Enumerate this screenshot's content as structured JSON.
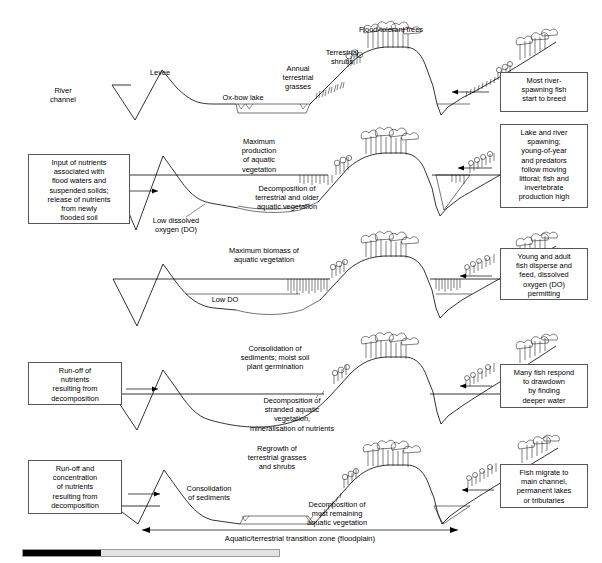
{
  "figure": {
    "type": "cross-section-diagram",
    "panel_count": 5,
    "transition_zone_label": "Aquatic/terrestrial transition zone (floodplain)"
  },
  "panels": [
    {
      "id": "panel-1",
      "stage": "rising-flood",
      "right_box": "Most river-\nspawning fish\nstart to breed",
      "labels": [
        {
          "name": "river-channel",
          "text": "River\nchannel"
        },
        {
          "name": "levee",
          "text": "Levee"
        },
        {
          "name": "ox-bow-lake",
          "text": "Ox-bow lake"
        },
        {
          "name": "annual-terrestrial-grasses",
          "text": "Annual\nterrestrial\ngrasses"
        },
        {
          "name": "terrestrial-shrubs",
          "text": "Terrestrial\nshrubs"
        },
        {
          "name": "flood-tolerant-trees",
          "text": "Flood-tolerant trees"
        }
      ]
    },
    {
      "id": "panel-2",
      "stage": "peak-flood",
      "left_box": "Input of nutrients\nassociated with\nflood waters and\nsuspended solids;\nrelease of nutrients\nfrom newly\nflooded soil",
      "right_box": "Lake and river\nspawning;\nyoung-of-year\nand predators\nfollow moving\nlittoral; fish and\ninvertebrate\nproduction high",
      "labels": [
        {
          "name": "maximum-production-aquatic-vegetation",
          "text": "Maximum\nproduction\nof aquatic\nvegetation"
        },
        {
          "name": "decomposition-terrestrial-older-aquatic",
          "text": "Decomposition  of\nterrestrial and older\naquatic vegetation"
        },
        {
          "name": "low-dissolved-oxygen",
          "text": "Low dissolved\noxygen (DO)"
        }
      ]
    },
    {
      "id": "panel-3",
      "stage": "high-water-plateau",
      "right_box": "Young and adult\nfish disperse and\nfeed, dissolved\noxygen (DO)\npermitting",
      "labels": [
        {
          "name": "maximum-biomass-aquatic-vegetation",
          "text": "Maximum biomass of\naquatic vegetation"
        },
        {
          "name": "low-do",
          "text": "Low DO"
        }
      ]
    },
    {
      "id": "panel-4",
      "stage": "drawdown",
      "left_box": "Run-off of\nnutrients\nresulting from\ndecomposition",
      "right_box": "Many fish respond\nto drawdown\nby finding\ndeeper water",
      "labels": [
        {
          "name": "consolidation-sediments-moist-soil",
          "text": "Consolidation of\nsediments; moist soil\nplant germination"
        },
        {
          "name": "decomposition-stranded-aquatic",
          "text": "Decomposition of\nstranded aquatic\nvegetation,\nmineralisation of nutrients"
        }
      ]
    },
    {
      "id": "panel-5",
      "stage": "low-water",
      "left_box": "Run-off and\nconcentration\nof nutrients\nresulting from\ndecomposition",
      "right_box": "Fish migrate to\nmain channel,\npermanent lakes\nor tributaries",
      "labels": [
        {
          "name": "regrowth-terrestrial-grasses-shrubs",
          "text": "Regrowth of\nterrestrial grasses\nand shrubs"
        },
        {
          "name": "consolidation-of-sediments",
          "text": "Consolidation\nof sediments"
        },
        {
          "name": "decomposition-most-remaining-aquatic",
          "text": "Decomposition of\nmost remaining\naquatic vegetation"
        }
      ]
    }
  ],
  "colors": {
    "stroke": "#000000",
    "box_border": "#555555",
    "background": "#ffffff",
    "scrollbar_track": "#e3e3e3",
    "scrollbar_thumb": "#000000"
  }
}
